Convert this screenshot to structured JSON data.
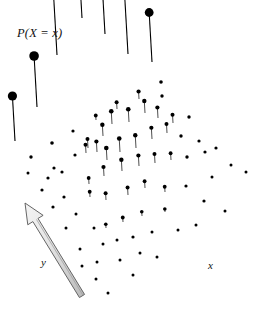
{
  "figure": {
    "title_label": "P(X = x)",
    "axis_x_label": "x",
    "axis_y_label": "y",
    "width": 253,
    "height": 320,
    "background_color": "#ffffff",
    "ink_color": "#000000",
    "arrow_fill_color": "#e8e8e8",
    "arrow_stroke_color": "#555555"
  },
  "chart_data": {
    "type": "scatter",
    "title": "P(X = x)",
    "xlabel": "x",
    "ylabel": "y",
    "zlabel": "P(X = x)",
    "grid": false,
    "legend": null,
    "projection": {
      "origin_px": [
        118,
        205
      ],
      "x_step_px": [
        21.5,
        7.0
      ],
      "y_step_px": [
        -13.5,
        9.5
      ],
      "z_scale_px_per_unit": 150
    },
    "axis_arrow": {
      "name": "y-axis direction arrow",
      "tail_px": [
        82,
        296
      ],
      "head_px": [
        25,
        203
      ],
      "shaft_width_px": 6,
      "head_width_px": 18,
      "head_length_px": 20
    },
    "marker_min_radius_px": 1.3,
    "marker_max_radius_px": 5.2,
    "stem_tilt_dx_px": -4,
    "points": [
      {
        "gx": -4,
        "gy": -4,
        "px": 15,
        "py": 141,
        "p": 0.3,
        "stem": true,
        "r": 4.6
      },
      {
        "gx": -3,
        "gy": -4,
        "px": 37,
        "py": 107,
        "p": 0.34,
        "stem": true,
        "r": 4.8
      },
      {
        "gx": -2,
        "gy": -4,
        "px": 57,
        "py": 55,
        "p": 0.43,
        "stem": true,
        "r": 5.2
      },
      {
        "gx": -1,
        "gy": -4,
        "px": 82,
        "py": 18,
        "p": 0.48,
        "stem": true,
        "r": 5.2
      },
      {
        "gx": 0,
        "gy": -4,
        "px": 105,
        "py": 34,
        "p": 0.44,
        "stem": true,
        "r": 5.0
      },
      {
        "gx": 1,
        "gy": -4,
        "px": 128,
        "py": 54,
        "p": 0.39,
        "stem": true,
        "r": 4.6
      },
      {
        "gx": 2,
        "gy": -4,
        "px": 152,
        "py": 62,
        "p": 0.33,
        "stem": true,
        "r": 4.4
      },
      {
        "gx": -3,
        "gy": -3,
        "px": 52,
        "py": 143,
        "p": 0.0,
        "stem": false,
        "r": 1.8
      },
      {
        "gx": -2,
        "gy": -3,
        "px": 73,
        "py": 131,
        "p": 0.0,
        "stem": false,
        "r": 1.6
      },
      {
        "gx": -1,
        "gy": -3,
        "px": 96,
        "py": 120,
        "p": 0.03,
        "stem": true,
        "r": 1.9
      },
      {
        "gx": 0,
        "gy": -3,
        "px": 117,
        "py": 109,
        "p": 0.045,
        "stem": true,
        "r": 2.0
      },
      {
        "gx": 1,
        "gy": -3,
        "px": 139,
        "py": 99,
        "p": 0.05,
        "stem": true,
        "r": 2.1
      },
      {
        "gx": 2,
        "gy": -3,
        "px": 161,
        "py": 82,
        "p": 0.0,
        "stem": false,
        "r": 1.8
      },
      {
        "gx": 3,
        "gy": -3,
        "px": 162,
        "py": 96,
        "p": 0.0,
        "stem": false,
        "r": 1.7
      },
      {
        "gx": -4,
        "gy": -2,
        "px": 31,
        "py": 157,
        "p": 0.0,
        "stem": false,
        "r": 1.7
      },
      {
        "gx": -3,
        "gy": -2,
        "px": 54,
        "py": 168,
        "p": 0.0,
        "stem": false,
        "r": 1.6
      },
      {
        "gx": -2,
        "gy": -2,
        "px": 75,
        "py": 155,
        "p": 0.0,
        "stem": false,
        "r": 1.6
      },
      {
        "gx": -1,
        "gy": -2,
        "px": 88,
        "py": 148,
        "p": 0.06,
        "stem": true,
        "r": 2.0
      },
      {
        "gx": 0,
        "gy": -2,
        "px": 103,
        "py": 136,
        "p": 0.075,
        "stem": true,
        "r": 2.2
      },
      {
        "gx": 1,
        "gy": -2,
        "px": 112,
        "py": 124,
        "p": 0.085,
        "stem": true,
        "r": 2.3
      },
      {
        "gx": 2,
        "gy": -2,
        "px": 129,
        "py": 122,
        "p": 0.085,
        "stem": true,
        "r": 2.3
      },
      {
        "gx": 3,
        "gy": -2,
        "px": 145,
        "py": 113,
        "p": 0.08,
        "stem": true,
        "r": 2.2
      },
      {
        "gx": 4,
        "gy": -2,
        "px": 158,
        "py": 118,
        "p": 0.07,
        "stem": true,
        "r": 2.1
      },
      {
        "gx": 5,
        "gy": -2,
        "px": 173,
        "py": 123,
        "p": 0.055,
        "stem": true,
        "r": 2.0
      },
      {
        "gx": 6,
        "gy": -2,
        "px": 189,
        "py": 117,
        "p": 0.0,
        "stem": false,
        "r": 1.7
      },
      {
        "gx": -4,
        "gy": -1,
        "px": 48,
        "py": 178,
        "p": 0.0,
        "stem": false,
        "r": 1.6
      },
      {
        "gx": -3,
        "gy": -1,
        "px": 62,
        "py": 172,
        "p": 0.0,
        "stem": false,
        "r": 1.6
      },
      {
        "gx": -2,
        "gy": -1,
        "px": 86,
        "py": 153,
        "p": 0.055,
        "stem": true,
        "r": 2.0
      },
      {
        "gx": -1,
        "gy": -1,
        "px": 97,
        "py": 152,
        "p": 0.07,
        "stem": true,
        "r": 2.1
      },
      {
        "gx": 0,
        "gy": -1,
        "px": 107,
        "py": 160,
        "p": 0.08,
        "stem": true,
        "r": 2.3
      },
      {
        "gx": 1,
        "gy": -1,
        "px": 120,
        "py": 152,
        "p": 0.09,
        "stem": true,
        "r": 2.3
      },
      {
        "gx": 2,
        "gy": -1,
        "px": 136,
        "py": 148,
        "p": 0.085,
        "stem": true,
        "r": 2.2
      },
      {
        "gx": 3,
        "gy": -1,
        "px": 152,
        "py": 139,
        "p": 0.075,
        "stem": true,
        "r": 2.1
      },
      {
        "gx": 4,
        "gy": -1,
        "px": 167,
        "py": 133,
        "p": 0.06,
        "stem": true,
        "r": 2.0
      },
      {
        "gx": 5,
        "gy": -1,
        "px": 181,
        "py": 136,
        "p": 0.0,
        "stem": false,
        "r": 1.7
      },
      {
        "gx": 6,
        "gy": -1,
        "px": 199,
        "py": 141,
        "p": 0.0,
        "stem": false,
        "r": 1.6
      },
      {
        "gx": 7,
        "gy": -1,
        "px": 216,
        "py": 148,
        "p": 0.0,
        "stem": false,
        "r": 1.6
      },
      {
        "gx": -5,
        "gy": 0,
        "px": 28,
        "py": 173,
        "p": 0.0,
        "stem": false,
        "r": 1.5
      },
      {
        "gx": -4,
        "gy": 0,
        "px": 42,
        "py": 190,
        "p": 0.0,
        "stem": false,
        "r": 1.6
      },
      {
        "gx": -3,
        "gy": 0,
        "px": 64,
        "py": 197,
        "p": 0.0,
        "stem": false,
        "r": 1.6
      },
      {
        "gx": -2,
        "gy": 0,
        "px": 89,
        "py": 184,
        "p": 0.04,
        "stem": true,
        "r": 1.9
      },
      {
        "gx": -1,
        "gy": 0,
        "px": 104,
        "py": 176,
        "p": 0.06,
        "stem": true,
        "r": 2.1
      },
      {
        "gx": 0,
        "gy": 0,
        "px": 122,
        "py": 171,
        "p": 0.075,
        "stem": true,
        "r": 2.2
      },
      {
        "gx": 1,
        "gy": 0,
        "px": 139,
        "py": 166,
        "p": 0.07,
        "stem": true,
        "r": 2.1
      },
      {
        "gx": 2,
        "gy": 0,
        "px": 155,
        "py": 163,
        "p": 0.06,
        "stem": true,
        "r": 2.0
      },
      {
        "gx": 3,
        "gy": 0,
        "px": 171,
        "py": 160,
        "p": 0.045,
        "stem": true,
        "r": 1.9
      },
      {
        "gx": 4,
        "gy": 0,
        "px": 187,
        "py": 157,
        "p": 0.0,
        "stem": false,
        "r": 1.7
      },
      {
        "gx": 5,
        "gy": 0,
        "px": 205,
        "py": 152,
        "p": 0.0,
        "stem": false,
        "r": 1.6
      },
      {
        "gx": 6,
        "gy": 0,
        "px": 231,
        "py": 165,
        "p": 0.0,
        "stem": false,
        "r": 1.5
      },
      {
        "gx": 7,
        "gy": 0,
        "px": 246,
        "py": 172,
        "p": 0.0,
        "stem": false,
        "r": 1.5
      },
      {
        "gx": -4,
        "gy": 1,
        "px": 53,
        "py": 207,
        "p": 0.0,
        "stem": false,
        "r": 1.6
      },
      {
        "gx": -3,
        "gy": 1,
        "px": 76,
        "py": 214,
        "p": 0.0,
        "stem": false,
        "r": 1.5
      },
      {
        "gx": -2,
        "gy": 1,
        "px": 90,
        "py": 197,
        "p": 0.035,
        "stem": true,
        "r": 1.9
      },
      {
        "gx": -1,
        "gy": 1,
        "px": 106,
        "py": 200,
        "p": 0.045,
        "stem": true,
        "r": 2.0
      },
      {
        "gx": 0,
        "gy": 1,
        "px": 128,
        "py": 195,
        "p": 0.05,
        "stem": true,
        "r": 2.0
      },
      {
        "gx": 1,
        "gy": 1,
        "px": 145,
        "py": 188,
        "p": 0.045,
        "stem": true,
        "r": 1.9
      },
      {
        "gx": 2,
        "gy": 1,
        "px": 165,
        "py": 192,
        "p": 0.035,
        "stem": true,
        "r": 1.9
      },
      {
        "gx": 3,
        "gy": 1,
        "px": 186,
        "py": 186,
        "p": 0.0,
        "stem": false,
        "r": 1.6
      },
      {
        "gx": 4,
        "gy": 1,
        "px": 212,
        "py": 177,
        "p": 0.0,
        "stem": false,
        "r": 1.5
      },
      {
        "gx": -3,
        "gy": 2,
        "px": 66,
        "py": 228,
        "p": 0.0,
        "stem": false,
        "r": 1.5
      },
      {
        "gx": -2,
        "gy": 2,
        "px": 94,
        "py": 228,
        "p": 0.0,
        "stem": false,
        "r": 1.5
      },
      {
        "gx": -1,
        "gy": 2,
        "px": 106,
        "py": 228,
        "p": 0.025,
        "stem": true,
        "r": 1.8
      },
      {
        "gx": 0,
        "gy": 2,
        "px": 123,
        "py": 222,
        "p": 0.03,
        "stem": true,
        "r": 1.9
      },
      {
        "gx": 1,
        "gy": 2,
        "px": 142,
        "py": 216,
        "p": 0.028,
        "stem": true,
        "r": 1.8
      },
      {
        "gx": 2,
        "gy": 2,
        "px": 165,
        "py": 212,
        "p": 0.02,
        "stem": true,
        "r": 1.8
      },
      {
        "gx": 3,
        "gy": 2,
        "px": 204,
        "py": 201,
        "p": 0.0,
        "stem": false,
        "r": 1.6
      },
      {
        "gx": 4,
        "gy": 2,
        "px": 225,
        "py": 211,
        "p": 0.0,
        "stem": false,
        "r": 1.5
      },
      {
        "gx": -3,
        "gy": 3,
        "px": 80,
        "py": 249,
        "p": 0.0,
        "stem": false,
        "r": 1.5
      },
      {
        "gx": -2,
        "gy": 3,
        "px": 103,
        "py": 244,
        "p": 0.0,
        "stem": false,
        "r": 1.5
      },
      {
        "gx": -1,
        "gy": 3,
        "px": 117,
        "py": 240,
        "p": 0.0,
        "stem": false,
        "r": 1.5
      },
      {
        "gx": 0,
        "gy": 3,
        "px": 133,
        "py": 237,
        "p": 0.0,
        "stem": false,
        "r": 1.6
      },
      {
        "gx": 1,
        "gy": 3,
        "px": 152,
        "py": 232,
        "p": 0.0,
        "stem": false,
        "r": 1.5
      },
      {
        "gx": 2,
        "gy": 3,
        "px": 178,
        "py": 230,
        "p": 0.0,
        "stem": false,
        "r": 1.5
      },
      {
        "gx": 3,
        "gy": 3,
        "px": 196,
        "py": 225,
        "p": 0.0,
        "stem": false,
        "r": 1.5
      },
      {
        "gx": -2,
        "gy": 4,
        "px": 82,
        "py": 266,
        "p": 0.0,
        "stem": false,
        "r": 1.5
      },
      {
        "gx": -1,
        "gy": 4,
        "px": 97,
        "py": 262,
        "p": 0.0,
        "stem": false,
        "r": 1.5
      },
      {
        "gx": 0,
        "gy": 4,
        "px": 120,
        "py": 260,
        "p": 0.0,
        "stem": false,
        "r": 1.5
      },
      {
        "gx": 1,
        "gy": 4,
        "px": 140,
        "py": 253,
        "p": 0.0,
        "stem": false,
        "r": 1.5
      },
      {
        "gx": 2,
        "gy": 4,
        "px": 157,
        "py": 257,
        "p": 0.0,
        "stem": false,
        "r": 1.5
      },
      {
        "gx": -1,
        "gy": 5,
        "px": 96,
        "py": 279,
        "p": 0.0,
        "stem": false,
        "r": 1.5
      },
      {
        "gx": 0,
        "gy": 5,
        "px": 133,
        "py": 275,
        "p": 0.0,
        "stem": false,
        "r": 1.5
      },
      {
        "gx": 1,
        "gy": 5,
        "px": 108,
        "py": 293,
        "p": 0.0,
        "stem": false,
        "r": 1.5
      }
    ]
  }
}
